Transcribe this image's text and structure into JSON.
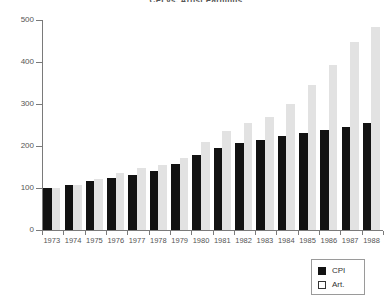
{
  "chart_data": {
    "type": "bar",
    "title": "CPI vs. Artist Earnings",
    "xlabel": "",
    "ylabel": "",
    "ylim": [
      0,
      500
    ],
    "yticks": [
      0,
      100,
      200,
      300,
      400,
      500
    ],
    "grid": false,
    "legend_position": "bottom-right",
    "categories": [
      "1973",
      "1974",
      "1975",
      "1976",
      "1977",
      "1978",
      "1979",
      "1980",
      "1981",
      "1982",
      "1983",
      "1984",
      "1985",
      "1986",
      "1987",
      "1988"
    ],
    "series": [
      {
        "name": "CPI",
        "color": "#121212",
        "values": [
          100,
          106,
          116,
          123,
          131,
          141,
          157,
          178,
          196,
          208,
          215,
          224,
          232,
          237,
          245,
          255
        ]
      },
      {
        "name": "Art.",
        "color": "#e2e2e2",
        "values": [
          100,
          107,
          122,
          135,
          148,
          155,
          172,
          210,
          235,
          254,
          268,
          300,
          345,
          392,
          448,
          483
        ]
      }
    ]
  },
  "legend": {
    "entries": [
      {
        "label": "CPI",
        "swatch": "filled"
      },
      {
        "label": "Art.",
        "swatch": "open"
      }
    ]
  }
}
